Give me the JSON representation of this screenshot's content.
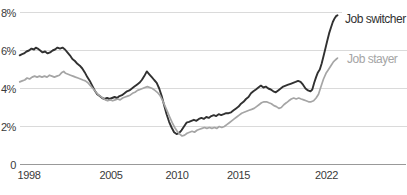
{
  "chart_data": {
    "type": "line",
    "title": "",
    "xlabel": "",
    "ylabel": "",
    "grid": "horizontal",
    "legend_position": "end-of-line-labels-right",
    "x_axis": {
      "ticks": [
        "1998",
        "2005",
        "2010",
        "2015",
        "2022"
      ],
      "range": [
        1997.25,
        2023.6
      ]
    },
    "y_axis": {
      "ticks": [
        {
          "label": "8%",
          "value": 8
        },
        {
          "label": "6%",
          "value": 6
        },
        {
          "label": "4%",
          "value": 4
        },
        {
          "label": "2%",
          "value": 2
        },
        {
          "label": "0",
          "value": 0
        }
      ],
      "range": [
        0,
        8.4
      ]
    },
    "colors": {
      "grid_line": "#dadada",
      "zero_axis": "#999999",
      "tick_text": "#3a3a3a"
    },
    "series": [
      {
        "name": "Job switcher",
        "color": "#313131",
        "stroke_width": 1.9,
        "points": [
          [
            1997.25,
            5.75
          ],
          [
            1997.4,
            5.8
          ],
          [
            1997.6,
            5.85
          ],
          [
            1997.8,
            5.95
          ],
          [
            1998.0,
            6.0
          ],
          [
            1998.2,
            6.1
          ],
          [
            1998.4,
            6.05
          ],
          [
            1998.55,
            6.15
          ],
          [
            1998.7,
            6.1
          ],
          [
            1998.9,
            6.0
          ],
          [
            1999.1,
            5.9
          ],
          [
            1999.3,
            5.95
          ],
          [
            1999.5,
            5.85
          ],
          [
            1999.7,
            5.9
          ],
          [
            1999.9,
            6.0
          ],
          [
            2000.1,
            6.05
          ],
          [
            2000.3,
            6.15
          ],
          [
            2000.5,
            6.1
          ],
          [
            2000.7,
            6.15
          ],
          [
            2000.9,
            6.05
          ],
          [
            2001.1,
            5.9
          ],
          [
            2001.3,
            5.75
          ],
          [
            2001.5,
            5.55
          ],
          [
            2001.7,
            5.45
          ],
          [
            2001.9,
            5.3
          ],
          [
            2002.1,
            5.2
          ],
          [
            2002.3,
            5.05
          ],
          [
            2002.5,
            4.85
          ],
          [
            2002.7,
            4.6
          ],
          [
            2002.9,
            4.4
          ],
          [
            2003.1,
            4.15
          ],
          [
            2003.3,
            3.9
          ],
          [
            2003.5,
            3.7
          ],
          [
            2003.7,
            3.6
          ],
          [
            2003.9,
            3.5
          ],
          [
            2004.1,
            3.45
          ],
          [
            2004.3,
            3.5
          ],
          [
            2004.5,
            3.45
          ],
          [
            2004.7,
            3.5
          ],
          [
            2004.9,
            3.55
          ],
          [
            2005.1,
            3.5
          ],
          [
            2005.3,
            3.6
          ],
          [
            2005.5,
            3.65
          ],
          [
            2005.7,
            3.75
          ],
          [
            2005.9,
            3.85
          ],
          [
            2006.1,
            3.9
          ],
          [
            2006.3,
            4.0
          ],
          [
            2006.5,
            4.1
          ],
          [
            2006.7,
            4.2
          ],
          [
            2006.9,
            4.3
          ],
          [
            2007.1,
            4.45
          ],
          [
            2007.3,
            4.65
          ],
          [
            2007.5,
            4.9
          ],
          [
            2007.7,
            4.75
          ],
          [
            2007.9,
            4.6
          ],
          [
            2008.1,
            4.45
          ],
          [
            2008.3,
            4.3
          ],
          [
            2008.5,
            4.0
          ],
          [
            2008.7,
            3.6
          ],
          [
            2008.9,
            3.1
          ],
          [
            2009.1,
            2.65
          ],
          [
            2009.3,
            2.25
          ],
          [
            2009.5,
            1.95
          ],
          [
            2009.7,
            1.7
          ],
          [
            2009.9,
            1.6
          ],
          [
            2010.1,
            1.65
          ],
          [
            2010.3,
            1.8
          ],
          [
            2010.5,
            2.0
          ],
          [
            2010.7,
            2.2
          ],
          [
            2010.9,
            2.25
          ],
          [
            2011.1,
            2.3
          ],
          [
            2011.3,
            2.35
          ],
          [
            2011.5,
            2.3
          ],
          [
            2011.7,
            2.4
          ],
          [
            2011.9,
            2.45
          ],
          [
            2012.1,
            2.4
          ],
          [
            2012.3,
            2.5
          ],
          [
            2012.5,
            2.45
          ],
          [
            2012.7,
            2.55
          ],
          [
            2012.9,
            2.6
          ],
          [
            2013.1,
            2.55
          ],
          [
            2013.3,
            2.65
          ],
          [
            2013.5,
            2.6
          ],
          [
            2013.7,
            2.65
          ],
          [
            2013.9,
            2.7
          ],
          [
            2014.1,
            2.7
          ],
          [
            2014.3,
            2.75
          ],
          [
            2014.5,
            2.85
          ],
          [
            2014.7,
            2.95
          ],
          [
            2014.9,
            3.05
          ],
          [
            2015.1,
            3.2
          ],
          [
            2015.3,
            3.3
          ],
          [
            2015.5,
            3.45
          ],
          [
            2015.7,
            3.55
          ],
          [
            2015.9,
            3.75
          ],
          [
            2016.1,
            3.85
          ],
          [
            2016.3,
            3.95
          ],
          [
            2016.5,
            4.05
          ],
          [
            2016.7,
            4.15
          ],
          [
            2016.9,
            4.05
          ],
          [
            2017.1,
            4.1
          ],
          [
            2017.3,
            4.0
          ],
          [
            2017.5,
            3.95
          ],
          [
            2017.7,
            3.85
          ],
          [
            2017.9,
            3.8
          ],
          [
            2018.1,
            3.9
          ],
          [
            2018.3,
            4.0
          ],
          [
            2018.5,
            4.1
          ],
          [
            2018.7,
            4.15
          ],
          [
            2018.9,
            4.2
          ],
          [
            2019.1,
            4.25
          ],
          [
            2019.3,
            4.3
          ],
          [
            2019.5,
            4.35
          ],
          [
            2019.7,
            4.4
          ],
          [
            2019.9,
            4.35
          ],
          [
            2020.1,
            4.2
          ],
          [
            2020.3,
            4.0
          ],
          [
            2020.5,
            3.9
          ],
          [
            2020.7,
            3.85
          ],
          [
            2020.85,
            3.95
          ],
          [
            2021.0,
            4.3
          ],
          [
            2021.15,
            4.6
          ],
          [
            2021.3,
            4.85
          ],
          [
            2021.45,
            5.0
          ],
          [
            2021.6,
            5.3
          ],
          [
            2021.75,
            5.7
          ],
          [
            2021.9,
            6.1
          ],
          [
            2022.05,
            6.5
          ],
          [
            2022.2,
            6.9
          ],
          [
            2022.35,
            7.2
          ],
          [
            2022.5,
            7.5
          ],
          [
            2022.65,
            7.7
          ],
          [
            2022.78,
            7.82
          ],
          [
            2022.88,
            7.85
          ]
        ]
      },
      {
        "name": "Job stayer",
        "color": "#a5a5a5",
        "stroke_width": 1.7,
        "points": [
          [
            1997.25,
            4.35
          ],
          [
            1997.45,
            4.4
          ],
          [
            1997.65,
            4.45
          ],
          [
            1997.85,
            4.55
          ],
          [
            1998.05,
            4.5
          ],
          [
            1998.25,
            4.6
          ],
          [
            1998.45,
            4.65
          ],
          [
            1998.65,
            4.6
          ],
          [
            1998.85,
            4.65
          ],
          [
            1999.05,
            4.6
          ],
          [
            1999.25,
            4.65
          ],
          [
            1999.45,
            4.6
          ],
          [
            1999.65,
            4.7
          ],
          [
            1999.85,
            4.65
          ],
          [
            2000.05,
            4.6
          ],
          [
            2000.25,
            4.65
          ],
          [
            2000.45,
            4.7
          ],
          [
            2000.65,
            4.85
          ],
          [
            2000.8,
            4.9
          ],
          [
            2000.95,
            4.8
          ],
          [
            2001.15,
            4.75
          ],
          [
            2001.35,
            4.7
          ],
          [
            2001.55,
            4.65
          ],
          [
            2001.75,
            4.6
          ],
          [
            2001.95,
            4.55
          ],
          [
            2002.15,
            4.5
          ],
          [
            2002.35,
            4.45
          ],
          [
            2002.55,
            4.4
          ],
          [
            2002.75,
            4.3
          ],
          [
            2002.95,
            4.15
          ],
          [
            2003.15,
            4.0
          ],
          [
            2003.35,
            3.85
          ],
          [
            2003.55,
            3.7
          ],
          [
            2003.75,
            3.6
          ],
          [
            2003.95,
            3.5
          ],
          [
            2004.15,
            3.4
          ],
          [
            2004.35,
            3.35
          ],
          [
            2004.55,
            3.4
          ],
          [
            2004.75,
            3.35
          ],
          [
            2004.95,
            3.4
          ],
          [
            2005.15,
            3.45
          ],
          [
            2005.35,
            3.4
          ],
          [
            2005.55,
            3.5
          ],
          [
            2005.75,
            3.55
          ],
          [
            2005.95,
            3.6
          ],
          [
            2006.15,
            3.65
          ],
          [
            2006.35,
            3.75
          ],
          [
            2006.55,
            3.8
          ],
          [
            2006.75,
            3.9
          ],
          [
            2006.95,
            3.95
          ],
          [
            2007.15,
            4.0
          ],
          [
            2007.35,
            4.05
          ],
          [
            2007.55,
            4.1
          ],
          [
            2007.75,
            4.05
          ],
          [
            2007.95,
            4.0
          ],
          [
            2008.15,
            3.9
          ],
          [
            2008.35,
            3.8
          ],
          [
            2008.55,
            3.65
          ],
          [
            2008.75,
            3.4
          ],
          [
            2008.95,
            3.1
          ],
          [
            2009.15,
            2.8
          ],
          [
            2009.35,
            2.5
          ],
          [
            2009.55,
            2.2
          ],
          [
            2009.75,
            1.95
          ],
          [
            2009.95,
            1.75
          ],
          [
            2010.15,
            1.6
          ],
          [
            2010.35,
            1.5
          ],
          [
            2010.55,
            1.55
          ],
          [
            2010.75,
            1.65
          ],
          [
            2010.95,
            1.7
          ],
          [
            2011.15,
            1.75
          ],
          [
            2011.35,
            1.7
          ],
          [
            2011.55,
            1.8
          ],
          [
            2011.75,
            1.85
          ],
          [
            2011.95,
            1.9
          ],
          [
            2012.15,
            1.95
          ],
          [
            2012.35,
            1.9
          ],
          [
            2012.55,
            1.95
          ],
          [
            2012.75,
            1.9
          ],
          [
            2012.95,
            1.95
          ],
          [
            2013.15,
            1.9
          ],
          [
            2013.35,
            2.0
          ],
          [
            2013.55,
            1.95
          ],
          [
            2013.75,
            2.0
          ],
          [
            2013.95,
            2.1
          ],
          [
            2014.15,
            2.2
          ],
          [
            2014.35,
            2.3
          ],
          [
            2014.55,
            2.4
          ],
          [
            2014.75,
            2.5
          ],
          [
            2014.95,
            2.6
          ],
          [
            2015.15,
            2.7
          ],
          [
            2015.35,
            2.75
          ],
          [
            2015.55,
            2.8
          ],
          [
            2015.75,
            2.85
          ],
          [
            2015.95,
            2.9
          ],
          [
            2016.15,
            2.95
          ],
          [
            2016.35,
            3.05
          ],
          [
            2016.55,
            3.15
          ],
          [
            2016.75,
            3.25
          ],
          [
            2016.95,
            3.3
          ],
          [
            2017.15,
            3.3
          ],
          [
            2017.35,
            3.25
          ],
          [
            2017.55,
            3.2
          ],
          [
            2017.75,
            3.1
          ],
          [
            2017.95,
            3.05
          ],
          [
            2018.15,
            2.95
          ],
          [
            2018.35,
            3.0
          ],
          [
            2018.55,
            3.15
          ],
          [
            2018.75,
            3.25
          ],
          [
            2018.95,
            3.35
          ],
          [
            2019.15,
            3.45
          ],
          [
            2019.35,
            3.5
          ],
          [
            2019.55,
            3.45
          ],
          [
            2019.75,
            3.5
          ],
          [
            2019.95,
            3.45
          ],
          [
            2020.15,
            3.4
          ],
          [
            2020.35,
            3.35
          ],
          [
            2020.55,
            3.3
          ],
          [
            2020.75,
            3.3
          ],
          [
            2020.95,
            3.35
          ],
          [
            2021.15,
            3.5
          ],
          [
            2021.35,
            3.7
          ],
          [
            2021.55,
            4.1
          ],
          [
            2021.75,
            4.5
          ],
          [
            2021.95,
            4.8
          ],
          [
            2022.15,
            5.0
          ],
          [
            2022.35,
            5.2
          ],
          [
            2022.55,
            5.4
          ],
          [
            2022.7,
            5.5
          ],
          [
            2022.88,
            5.6
          ]
        ]
      }
    ]
  }
}
